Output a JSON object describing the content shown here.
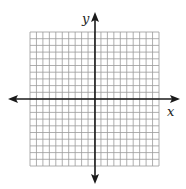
{
  "diagram": {
    "type": "coordinate-plane",
    "x_axis_label": "x",
    "y_axis_label": "y",
    "grid": {
      "columns": 20,
      "rows": 20,
      "x_range": [
        -10,
        10
      ],
      "y_range": [
        -10,
        10
      ]
    },
    "colors": {
      "grid": "#9a9a9a",
      "axis": "#1a1a1a",
      "background": "#ffffff"
    }
  }
}
